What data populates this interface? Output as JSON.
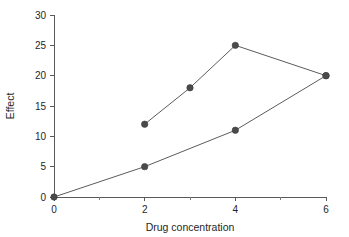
{
  "chart_data": {
    "type": "line",
    "title": "",
    "xlabel": "Drug concentration",
    "ylabel": "Effect",
    "xlim": [
      0,
      6
    ],
    "ylim": [
      0,
      30
    ],
    "x_ticks_major": [
      0,
      2,
      4,
      6
    ],
    "x_ticks_minor": [
      1,
      3,
      5
    ],
    "y_ticks_major": [
      0,
      5,
      10,
      15,
      20,
      25,
      30
    ],
    "x_tick_labels": [
      "0",
      "2",
      "4",
      "6"
    ],
    "y_tick_labels": [
      "0",
      "5",
      "10",
      "15",
      "20",
      "25",
      "30"
    ],
    "grid": false,
    "legend": "none",
    "marker_color": "#4a4a4a",
    "line_color": "#5c5c5c",
    "axis_color": "#5a5a5a",
    "background_color": "#ffffff",
    "series": [
      {
        "name": "upper-curve",
        "points": [
          {
            "x": 2,
            "y": 12
          },
          {
            "x": 3,
            "y": 18
          },
          {
            "x": 4,
            "y": 25
          },
          {
            "x": 6,
            "y": 20
          }
        ]
      },
      {
        "name": "lower-curve",
        "points": [
          {
            "x": 0,
            "y": 0
          },
          {
            "x": 2,
            "y": 5
          },
          {
            "x": 4,
            "y": 11
          },
          {
            "x": 6,
            "y": 20
          }
        ]
      }
    ]
  }
}
